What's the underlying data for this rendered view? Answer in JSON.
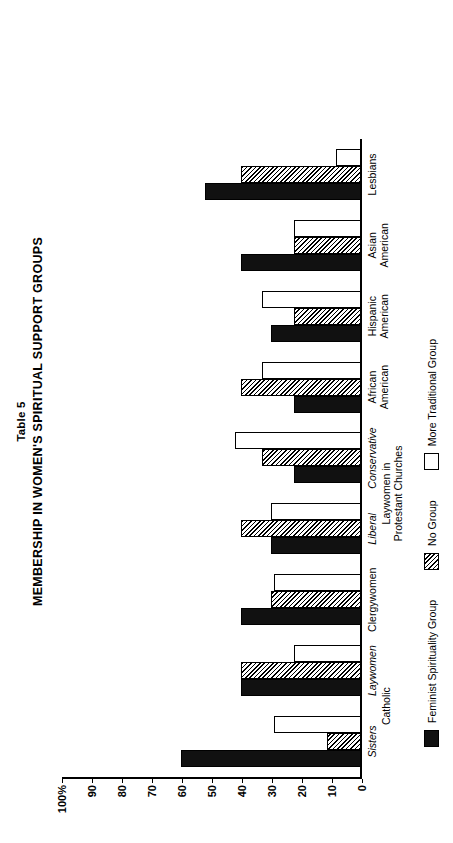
{
  "figure": {
    "table_number": "Table 5",
    "title": "MEMBERSHIP IN WOMEN'S SPIRITUAL SUPPORT GROUPS"
  },
  "axis": {
    "ticks": [
      "100%",
      "90",
      "80",
      "70",
      "60",
      "50",
      "40",
      "30",
      "20",
      "10",
      "0"
    ],
    "tick_values": [
      100,
      90,
      80,
      70,
      60,
      50,
      40,
      30,
      20,
      10,
      0
    ]
  },
  "superlabels": {
    "catholic": "Catholic",
    "protestant_line1": "Laywomen in",
    "protestant_line2": "Protestant Churches"
  },
  "legend": {
    "items": [
      {
        "key": "feminist",
        "label": "Feminist Spirituality Group",
        "swatch": "s0",
        "color": "#111111"
      },
      {
        "key": "nogroup",
        "label": "No Group",
        "swatch": "s1",
        "color": "#ffffff"
      },
      {
        "key": "traditional",
        "label": "More Traditional Group",
        "swatch": "s2",
        "color": "#ffffff"
      }
    ]
  },
  "chart_data": {
    "type": "bar",
    "title": "MEMBERSHIP IN WOMEN'S SPIRITUAL SUPPORT GROUPS",
    "subtitle": "Table 5",
    "xlabel": "",
    "ylabel": "",
    "ylim": [
      0,
      100
    ],
    "yticks": [
      0,
      10,
      20,
      30,
      40,
      50,
      60,
      70,
      80,
      90,
      100
    ],
    "grid": false,
    "legend_position": "bottom",
    "orientation": "vertical-bars-printed-rotated-90",
    "categories": [
      "Sisters",
      "Laywomen",
      "Clergywomen",
      "Liberal",
      "Conservative",
      "African American",
      "Hispanic American",
      "Asian American",
      "Lesbians"
    ],
    "category_labels": [
      {
        "line1": "Sisters",
        "line2": "",
        "italic": true
      },
      {
        "line1": "Laywomen",
        "line2": "",
        "italic": true
      },
      {
        "line1": "Clergywomen",
        "line2": "",
        "italic": false
      },
      {
        "line1": "Liberal",
        "line2": "",
        "italic": true
      },
      {
        "line1": "Conservative",
        "line2": "",
        "italic": true
      },
      {
        "line1": "African",
        "line2": "American",
        "italic": false
      },
      {
        "line1": "Hispanic",
        "line2": "American",
        "italic": false
      },
      {
        "line1": "Asian",
        "line2": "American",
        "italic": false
      },
      {
        "line1": "Lesbians",
        "line2": "",
        "italic": false
      }
    ],
    "series": [
      {
        "name": "Feminist Spirituality Group",
        "swatch": "s0",
        "values": [
          60,
          40,
          40,
          30,
          22,
          22,
          30,
          40,
          52
        ]
      },
      {
        "name": "No Group",
        "swatch": "s1",
        "values": [
          11,
          40,
          30,
          40,
          33,
          40,
          22,
          22,
          40
        ]
      },
      {
        "name": "More Traditional Group",
        "swatch": "s2",
        "values": [
          29,
          22,
          29,
          30,
          42,
          33,
          33,
          22,
          8
        ]
      }
    ]
  }
}
